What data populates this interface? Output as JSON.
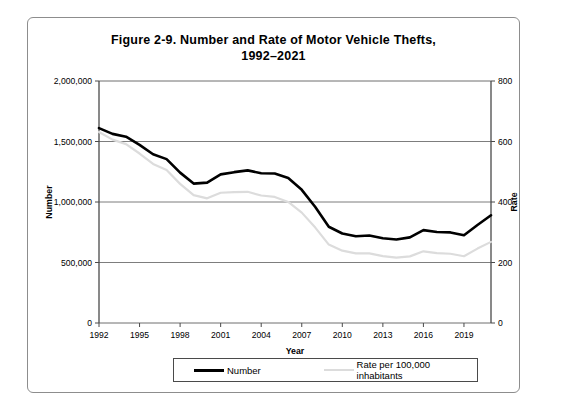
{
  "title": {
    "line1": "Figure 2-9. Number and Rate of Motor Vehicle Thefts,",
    "line2": "1992–2021"
  },
  "legend": {
    "number_label": "Number",
    "rate_label": "Rate per 100,000 inhabitants"
  },
  "chart_data": {
    "type": "line",
    "title": "Figure 2-9. Number and Rate of Motor Vehicle Thefts, 1992–2021",
    "xlabel": "Year",
    "ylabel": "Number",
    "y2label": "Rate",
    "grid": true,
    "legend_position": "bottom",
    "xlim": [
      1992,
      2021
    ],
    "ylim": [
      0,
      2000000
    ],
    "y2lim": [
      0,
      800
    ],
    "xticks": [
      1992,
      1995,
      1998,
      2001,
      2004,
      2007,
      2010,
      2013,
      2016,
      2019
    ],
    "xticklabels": [
      "1992",
      "1995",
      "1998",
      "2001",
      "2004",
      "2007",
      "2010",
      "2013",
      "2016",
      "2019"
    ],
    "yticks": [
      0,
      500000,
      1000000,
      1500000,
      2000000
    ],
    "yticklabels": [
      "0",
      "500,000",
      "1,000,000",
      "1,500,000",
      "2,000,000"
    ],
    "y2ticks": [
      0,
      200,
      400,
      600,
      800
    ],
    "y2ticklabels": [
      "0",
      "200",
      "400",
      "600",
      "800"
    ],
    "x": [
      1992,
      1993,
      1994,
      1995,
      1996,
      1997,
      1998,
      1999,
      2000,
      2001,
      2002,
      2003,
      2004,
      2005,
      2006,
      2007,
      2008,
      2009,
      2010,
      2011,
      2012,
      2013,
      2014,
      2015,
      2016,
      2017,
      2018,
      2019,
      2020,
      2021
    ],
    "series": [
      {
        "name": "Number",
        "axis": "left",
        "color": "#000000",
        "width": 2.6,
        "values": [
          1610800,
          1563100,
          1539300,
          1472400,
          1394200,
          1354200,
          1242800,
          1152100,
          1160000,
          1228400,
          1246600,
          1261200,
          1237900,
          1235200,
          1198400,
          1100500,
          959100,
          795700,
          739600,
          716500,
          723200,
          700300,
          689500,
          707800,
          767300,
          751800,
          748800,
          724900,
          810400,
          890200
        ]
      },
      {
        "name": "Rate per 100,000 inhabitants",
        "axis": "right",
        "color": "#dcdcdc",
        "width": 2.2,
        "values": [
          631.6,
          606.3,
          591.3,
          560.3,
          525.7,
          505.7,
          459.9,
          422.5,
          412.2,
          430.5,
          432.9,
          433.7,
          421.5,
          416.8,
          400.2,
          364.9,
          315.4,
          259.2,
          239.1,
          230.0,
          230.4,
          221.3,
          216.2,
          220.2,
          236.9,
          231.0,
          228.9,
          220.8,
          246.0,
          268.2
        ]
      }
    ]
  }
}
